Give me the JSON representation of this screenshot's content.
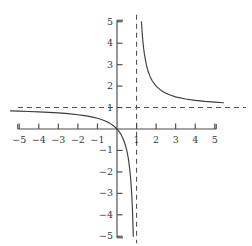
{
  "chart_data": {
    "type": "line",
    "title": "",
    "subtitle": "",
    "xlabel": "",
    "ylabel": "",
    "xlim": [
      -5,
      5
    ],
    "ylim": [
      -5,
      5
    ],
    "grid": false,
    "legend": "none",
    "function": "y = x/(x - 1)",
    "x_ticks": [
      -5,
      -4,
      -3,
      -2,
      -1,
      1,
      2,
      3,
      4,
      5
    ],
    "y_ticks": [
      -5,
      -4,
      -3,
      -2,
      -1,
      1,
      2,
      3,
      4,
      5
    ],
    "x_tick_labels": [
      "−5",
      "−4",
      "−3",
      "−2",
      "−1",
      "1",
      "2",
      "3",
      "4",
      "5"
    ],
    "y_tick_labels": [
      "−5",
      "−4",
      "−3",
      "−2",
      "−1",
      "1",
      "2",
      "3",
      "4",
      "5"
    ],
    "asymptotes": [
      {
        "name": "vertical-asymptote",
        "orientation": "vertical",
        "value": 1,
        "style": "dashed"
      },
      {
        "name": "horizontal-asymptote",
        "orientation": "horizontal",
        "value": 1,
        "style": "dashed"
      }
    ],
    "series": [
      {
        "name": "left-branch",
        "style": "solid",
        "color": "#3c3c3c",
        "points": [
          [
            -5.45,
            0.8462
          ],
          [
            -5.0,
            0.8333
          ],
          [
            -4.5,
            0.8182
          ],
          [
            -4.0,
            0.8
          ],
          [
            -3.5,
            0.7778
          ],
          [
            -3.0,
            0.75
          ],
          [
            -2.5,
            0.7143
          ],
          [
            -2.0,
            0.6667
          ],
          [
            -1.75,
            0.6364
          ],
          [
            -1.5,
            0.6
          ],
          [
            -1.25,
            0.5556
          ],
          [
            -1.0,
            0.5
          ],
          [
            -0.8,
            0.4444
          ],
          [
            -0.6,
            0.375
          ],
          [
            -0.4,
            0.2857
          ],
          [
            -0.2,
            0.1667
          ],
          [
            0.0,
            0.0
          ],
          [
            0.1,
            -0.1111
          ],
          [
            0.2,
            -0.25
          ],
          [
            0.3,
            -0.4286
          ],
          [
            0.4,
            -0.6667
          ],
          [
            0.5,
            -1.0
          ],
          [
            0.55,
            -1.2222
          ],
          [
            0.6,
            -1.5
          ],
          [
            0.65,
            -1.8571
          ],
          [
            0.7,
            -2.3333
          ],
          [
            0.75,
            -3.0
          ],
          [
            0.78,
            -3.5455
          ],
          [
            0.8,
            -4.0
          ],
          [
            0.83,
            -4.8824
          ],
          [
            0.8333,
            -5.0
          ]
        ]
      },
      {
        "name": "right-branch",
        "style": "solid",
        "color": "#3c3c3c",
        "points": [
          [
            1.25,
            5.0
          ],
          [
            1.3,
            4.3333
          ],
          [
            1.35,
            3.8571
          ],
          [
            1.4,
            3.5
          ],
          [
            1.5,
            3.0
          ],
          [
            1.6,
            2.6667
          ],
          [
            1.7,
            2.4286
          ],
          [
            1.8,
            2.25
          ],
          [
            2.0,
            2.0
          ],
          [
            2.25,
            1.8
          ],
          [
            2.5,
            1.6667
          ],
          [
            2.75,
            1.5714
          ],
          [
            3.0,
            1.5
          ],
          [
            3.5,
            1.4
          ],
          [
            4.0,
            1.3333
          ],
          [
            4.5,
            1.2857
          ],
          [
            5.0,
            1.25
          ],
          [
            5.45,
            1.2247
          ]
        ]
      }
    ],
    "notable_points": [
      {
        "name": "origin-crossing",
        "x": 0,
        "y": 0
      }
    ]
  }
}
